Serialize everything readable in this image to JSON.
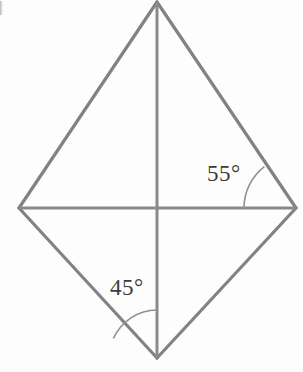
{
  "figure": {
    "type": "geometry-diagram",
    "background_color": "#fdfdfd",
    "stroke_color": "#808080",
    "stroke_width": 3,
    "label_color": "#3b3b3b",
    "width": 303,
    "height": 372
  },
  "vertices": {
    "top": {
      "name": "top-vertex",
      "x": 157,
      "y": 2
    },
    "left": {
      "name": "left-vertex",
      "x": 19,
      "y": 208
    },
    "right": {
      "name": "right-vertex",
      "x": 296,
      "y": 208
    },
    "bottom": {
      "name": "bottom-vertex",
      "x": 157,
      "y": 358
    },
    "center": {
      "name": "diagonal-intersection",
      "x": 157,
      "y": 208
    }
  },
  "edges": [
    {
      "name": "edge-top-left",
      "from": "top",
      "to": "left"
    },
    {
      "name": "edge-top-right",
      "from": "top",
      "to": "right"
    },
    {
      "name": "edge-left-bottom",
      "from": "left",
      "to": "bottom"
    },
    {
      "name": "edge-right-bottom",
      "from": "right",
      "to": "bottom"
    }
  ],
  "diagonals": [
    {
      "name": "diagonal-vertical",
      "from": "top",
      "to": "bottom"
    },
    {
      "name": "diagonal-horizontal",
      "from": "left",
      "to": "right"
    }
  ],
  "angles": [
    {
      "name": "angle-55",
      "label": "55°",
      "value": 55,
      "unit": "degrees",
      "at_vertex": "right",
      "between": [
        "diagonal-horizontal",
        "edge-top-right"
      ],
      "arc_radius": 52
    },
    {
      "name": "angle-45",
      "label": "45°",
      "value": 45,
      "unit": "degrees",
      "at_vertex": "bottom",
      "between": [
        "edge-left-bottom",
        "diagonal-vertical"
      ],
      "arc_radius": 48
    }
  ],
  "labels": {
    "angle_right": "55°",
    "angle_bottom": "45°"
  }
}
